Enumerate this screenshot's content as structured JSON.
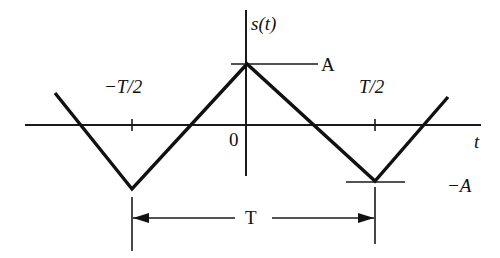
{
  "labels": {
    "y_axis": "s(t)",
    "x_axis": "t",
    "origin": "0",
    "neg_half_period": "−T/2",
    "pos_half_period": "T/2",
    "amplitude_pos": "A",
    "amplitude_neg": "−A",
    "period": "T"
  },
  "waveform": {
    "type": "triangle",
    "description": "Periodic triangular wave s(t) with peak A at t=0 and troughs −A at t=±T/2, period T",
    "points_px": [
      [
        55,
        93
      ],
      [
        132,
        189
      ],
      [
        247,
        64
      ],
      [
        375,
        181
      ],
      [
        448,
        97
      ]
    ]
  },
  "colors": {
    "ink": "#111111",
    "background": "#ffffff"
  }
}
